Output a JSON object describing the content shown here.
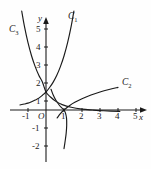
{
  "figure": {
    "background_color": "#fefefe",
    "curve_color": "#1a1a1a",
    "axis_color": "#1a1a1a"
  },
  "axes": {
    "x_axis_label": "x",
    "y_axis_label": "y",
    "origin_label": "O",
    "x_ticks": [
      "-1",
      "1",
      "2",
      "3",
      "4",
      "5"
    ],
    "y_ticks": [
      "5",
      "4",
      "3",
      "2",
      "1",
      "-1",
      "-2"
    ],
    "x_range": [
      -1.6,
      5.9
    ],
    "y_range": [
      -2.6,
      6.2
    ]
  },
  "curve_labels": [
    {
      "name": "C",
      "sub": "1"
    },
    {
      "name": "C",
      "sub": "2"
    },
    {
      "name": "C",
      "sub": "3"
    }
  ],
  "chart_data": {
    "type": "line",
    "title": "",
    "xlabel": "x",
    "ylabel": "y",
    "xlim": [
      -1.6,
      5.9
    ],
    "ylim": [
      -2.6,
      6.2
    ],
    "grid": false,
    "legend": "inline curve labels",
    "x_ticks": [
      -1,
      1,
      2,
      3,
      4,
      5
    ],
    "y_ticks": [
      5,
      4,
      3,
      2,
      1,
      -1,
      -2
    ],
    "series": [
      {
        "name": "C1",
        "description": "increasing exponential through (0,1)",
        "label_position": [
          1.55,
          6.0
        ],
        "points": [
          [
            -1.45,
            0.28
          ],
          [
            -1.2,
            0.33
          ],
          [
            -1.0,
            0.38
          ],
          [
            -0.8,
            0.46
          ],
          [
            -0.6,
            0.55
          ],
          [
            -0.4,
            0.66
          ],
          [
            -0.2,
            0.82
          ],
          [
            0.0,
            1.0
          ],
          [
            0.2,
            1.25
          ],
          [
            0.4,
            1.55
          ],
          [
            0.6,
            1.93
          ],
          [
            0.8,
            2.41
          ],
          [
            1.0,
            3.0
          ],
          [
            1.2,
            3.74
          ],
          [
            1.4,
            4.66
          ],
          [
            1.55,
            5.5
          ]
        ]
      },
      {
        "name": "C2",
        "description": "increasing logarithm through (1,0)",
        "label_position": [
          4.25,
          1.35
        ],
        "points": [
          [
            0.62,
            -0.44
          ],
          [
            0.8,
            -0.2
          ],
          [
            1.0,
            0.0
          ],
          [
            1.3,
            0.24
          ],
          [
            1.6,
            0.43
          ],
          [
            2.0,
            0.63
          ],
          [
            2.5,
            0.83
          ],
          [
            3.0,
            1.0
          ],
          [
            3.5,
            1.14
          ],
          [
            4.0,
            1.26
          ]
        ]
      },
      {
        "name": "C3",
        "description": "decreasing exponential through (0,1)",
        "label_position": [
          -1.75,
          4.45
        ],
        "points": [
          [
            -1.35,
            5.5
          ],
          [
            -1.2,
            4.66
          ],
          [
            -1.0,
            3.74
          ],
          [
            -0.8,
            3.0
          ],
          [
            -0.6,
            2.41
          ],
          [
            -0.4,
            1.93
          ],
          [
            -0.2,
            1.55
          ],
          [
            0.0,
            1.0
          ],
          [
            0.25,
            0.72
          ],
          [
            0.55,
            0.48
          ],
          [
            0.9,
            0.3
          ],
          [
            1.4,
            0.15
          ],
          [
            2.0,
            0.05
          ],
          [
            2.6,
            0.0
          ],
          [
            3.2,
            -0.04
          ],
          [
            4.1,
            -0.08
          ]
        ]
      },
      {
        "name": "C4",
        "description": "decreasing logarithm through (1,0) falling to -2",
        "label_position": null,
        "points": [
          [
            0.28,
            1.15
          ],
          [
            0.4,
            0.83
          ],
          [
            0.55,
            0.54
          ],
          [
            0.7,
            0.32
          ],
          [
            0.85,
            0.14
          ],
          [
            1.0,
            0.0
          ],
          [
            1.08,
            -0.16
          ],
          [
            1.14,
            -0.45
          ],
          [
            1.15,
            -0.85
          ],
          [
            1.12,
            -1.3
          ],
          [
            1.06,
            -1.75
          ],
          [
            1.0,
            -2.15
          ]
        ]
      }
    ]
  }
}
